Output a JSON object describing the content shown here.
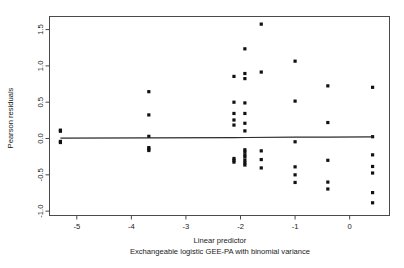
{
  "chart_data": {
    "type": "scatter",
    "title": "",
    "xlabel": "Linear predictor",
    "sublabel": "Exchangeable logistic GEE-PA with binomial variance",
    "ylabel": "Pearson residuals",
    "xlim": [
      -5.5,
      0.73
    ],
    "ylim": [
      -1.06,
      1.68
    ],
    "xticks": [
      -5,
      -4,
      -3,
      -2,
      -1,
      0
    ],
    "xticklabels": [
      "-5",
      "-4",
      "-3",
      "-2",
      "-1",
      "0"
    ],
    "yticks": [
      -1.0,
      -0.5,
      0.0,
      0.5,
      1.0,
      1.5
    ],
    "yticklabels": [
      "-1.0",
      "-0.5",
      "0.0",
      "0.5",
      "1.0",
      "1.5"
    ],
    "grid": false,
    "legend": null,
    "point_color": "#111111",
    "point_size_px": 1.6,
    "frame_color": "#4a4a4a",
    "fit_line": {
      "type": "lowess",
      "color": "#2b2b2b",
      "x": [
        -5.3,
        -3.68,
        -2.1,
        -1.9,
        -1.0,
        -0.4,
        0.42
      ],
      "y": [
        0.004,
        0.009,
        0.013,
        0.014,
        0.018,
        0.02,
        0.022
      ]
    },
    "points": [
      {
        "x": -5.3,
        "y": 0.115
      },
      {
        "x": -5.3,
        "y": 0.1
      },
      {
        "x": -5.3,
        "y": -0.04
      },
      {
        "x": -5.3,
        "y": -0.055
      },
      {
        "x": -3.68,
        "y": 0.645
      },
      {
        "x": -3.68,
        "y": 0.325
      },
      {
        "x": -3.68,
        "y": 0.03
      },
      {
        "x": -3.68,
        "y": -0.125
      },
      {
        "x": -3.68,
        "y": -0.145
      },
      {
        "x": -3.68,
        "y": -0.165
      },
      {
        "x": -2.12,
        "y": 0.855
      },
      {
        "x": -2.12,
        "y": 0.5
      },
      {
        "x": -2.12,
        "y": 0.345
      },
      {
        "x": -2.12,
        "y": 0.255
      },
      {
        "x": -2.12,
        "y": 0.185
      },
      {
        "x": -2.12,
        "y": -0.275
      },
      {
        "x": -2.12,
        "y": -0.3
      },
      {
        "x": -2.12,
        "y": -0.325
      },
      {
        "x": -1.92,
        "y": 1.235
      },
      {
        "x": -1.92,
        "y": 0.895
      },
      {
        "x": -1.92,
        "y": 0.825
      },
      {
        "x": -1.92,
        "y": 0.49
      },
      {
        "x": -1.92,
        "y": 0.345
      },
      {
        "x": -1.92,
        "y": 0.21
      },
      {
        "x": -1.92,
        "y": 0.105
      },
      {
        "x": -1.92,
        "y": -0.155
      },
      {
        "x": -1.92,
        "y": -0.185
      },
      {
        "x": -1.92,
        "y": -0.225
      },
      {
        "x": -1.92,
        "y": -0.255
      },
      {
        "x": -1.92,
        "y": -0.3
      },
      {
        "x": -1.92,
        "y": -0.335
      },
      {
        "x": -1.92,
        "y": -0.365
      },
      {
        "x": -1.62,
        "y": 1.575
      },
      {
        "x": -1.62,
        "y": 0.915
      },
      {
        "x": -1.62,
        "y": -0.17
      },
      {
        "x": -1.62,
        "y": -0.29
      },
      {
        "x": -1.62,
        "y": -0.405
      },
      {
        "x": -1.0,
        "y": 1.065
      },
      {
        "x": -1.0,
        "y": 0.515
      },
      {
        "x": -1.0,
        "y": -0.045
      },
      {
        "x": -1.0,
        "y": -0.39
      },
      {
        "x": -1.0,
        "y": -0.5
      },
      {
        "x": -1.0,
        "y": -0.605
      },
      {
        "x": -0.4,
        "y": 0.725
      },
      {
        "x": -0.4,
        "y": 0.22
      },
      {
        "x": -0.4,
        "y": -0.3
      },
      {
        "x": -0.4,
        "y": -0.6
      },
      {
        "x": -0.4,
        "y": -0.695
      },
      {
        "x": 0.42,
        "y": 0.705
      },
      {
        "x": 0.42,
        "y": 0.025
      },
      {
        "x": 0.42,
        "y": -0.225
      },
      {
        "x": 0.42,
        "y": -0.385
      },
      {
        "x": 0.42,
        "y": -0.475
      },
      {
        "x": 0.42,
        "y": -0.745
      },
      {
        "x": 0.42,
        "y": -0.885
      }
    ]
  }
}
